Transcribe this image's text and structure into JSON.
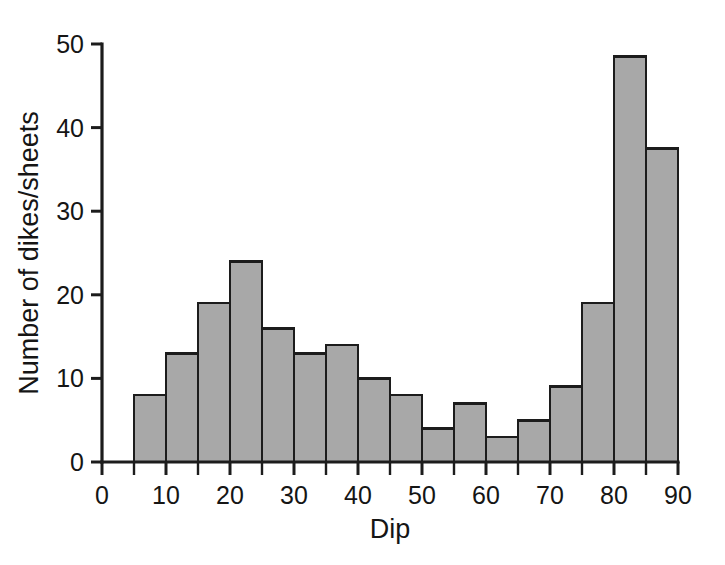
{
  "chart_data": {
    "type": "bar",
    "title": "",
    "subtitle": "",
    "xlabel": "Dip",
    "ylabel": "Number of dikes/sheets",
    "xlim": [
      0,
      90
    ],
    "ylim": [
      0,
      50
    ],
    "grid": false,
    "legend": null,
    "bin_width": 5,
    "bin_edges": [
      5,
      10,
      15,
      20,
      25,
      30,
      35,
      40,
      45,
      50,
      55,
      60,
      65,
      70,
      75,
      80,
      85,
      90
    ],
    "categories": [
      "5-10",
      "10-15",
      "15-20",
      "20-25",
      "25-30",
      "30-35",
      "35-40",
      "40-45",
      "45-50",
      "50-55",
      "55-60",
      "60-65",
      "65-70",
      "70-75",
      "75-80",
      "80-85",
      "85-90"
    ],
    "values": [
      8,
      13,
      19,
      24,
      16,
      13,
      14,
      10,
      8,
      4,
      7,
      3,
      5,
      9,
      19,
      48.5,
      37.5
    ],
    "x_ticks_major": [
      0,
      10,
      20,
      30,
      40,
      50,
      60,
      70,
      80,
      90
    ],
    "x_ticks_minor": [
      5,
      15,
      25,
      35,
      45,
      55,
      65,
      75,
      85
    ],
    "x_tick_labels": [
      "0",
      "10",
      "20",
      "30",
      "40",
      "50",
      "60",
      "70",
      "80",
      "90"
    ],
    "y_ticks_major": [
      0,
      10,
      20,
      30,
      40,
      50
    ],
    "y_tick_labels": [
      "0",
      "10",
      "20",
      "30",
      "40",
      "50"
    ],
    "colors": {
      "bar_fill": "#a8a8a8",
      "bar_stroke": "#1c1c1c",
      "axis": "#1c1c1c",
      "text": "#151515",
      "background": "#ffffff"
    }
  }
}
